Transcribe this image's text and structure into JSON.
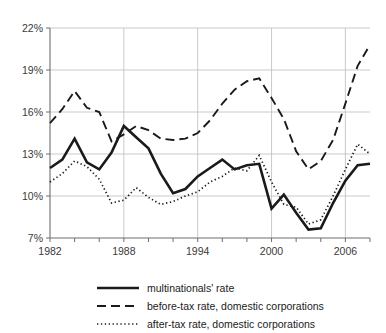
{
  "chart_data": {
    "type": "line",
    "title": "",
    "subtitle": "",
    "xlabel": "",
    "ylabel": "",
    "x": [
      1982,
      1983,
      1984,
      1985,
      1986,
      1987,
      1988,
      1989,
      1990,
      1991,
      1992,
      1993,
      1994,
      1995,
      1996,
      1997,
      1998,
      1999,
      2000,
      2001,
      2002,
      2003,
      2004,
      2005,
      2006,
      2007,
      2008
    ],
    "xlim": [
      1982,
      2008
    ],
    "ylim": [
      7,
      22
    ],
    "xticks": [
      1982,
      1988,
      1994,
      2000,
      2006
    ],
    "xticklabels": [
      "1982",
      "1988",
      "1994",
      "2000",
      "2006"
    ],
    "yticks": [
      7,
      10,
      13,
      16,
      19,
      22
    ],
    "yticklabels": [
      "7%",
      "10%",
      "13%",
      "16%",
      "19%",
      "22%"
    ],
    "grid": true,
    "legend_position": "bottom",
    "series": [
      {
        "name": "multinationals' rate",
        "style": "solid",
        "values": [
          12.0,
          12.6,
          14.1,
          12.4,
          11.9,
          13.1,
          15.0,
          14.2,
          13.4,
          11.6,
          10.2,
          10.5,
          11.4,
          12.0,
          12.6,
          11.9,
          12.2,
          12.3,
          9.1,
          10.1,
          8.8,
          7.6,
          7.7,
          9.5,
          11.1,
          12.2,
          12.3
        ]
      },
      {
        "name": "before-tax rate, domestic corporations",
        "style": "dashed",
        "values": [
          15.2,
          16.2,
          17.5,
          16.3,
          16.0,
          13.9,
          14.4,
          15.0,
          14.7,
          14.1,
          14.0,
          14.1,
          14.5,
          15.4,
          16.6,
          17.6,
          18.2,
          18.4,
          17.0,
          15.5,
          13.2,
          11.9,
          12.5,
          14.0,
          16.6,
          19.3,
          20.8
        ]
      },
      {
        "name": "after-tax rate, domestic corporations",
        "style": "dotted",
        "values": [
          11.0,
          11.6,
          12.5,
          12.1,
          11.2,
          9.5,
          9.7,
          10.6,
          9.9,
          9.4,
          9.6,
          10.0,
          10.3,
          11.0,
          11.4,
          12.0,
          11.8,
          12.9,
          11.0,
          9.4,
          9.2,
          8.0,
          8.3,
          10.0,
          11.9,
          13.7,
          13.0
        ]
      }
    ],
    "series_tail": {
      "multinationals_rate_end": [
        12.2,
        11.7,
        11.8,
        9.2
      ],
      "before_tax_end": [
        17.4,
        13.0,
        12.3,
        12.2
      ],
      "after_tax_end": [
        12.4,
        10.2,
        8.6,
        9.2
      ]
    }
  },
  "legend": {
    "items": [
      {
        "label": "multinationals' rate",
        "style": "solid"
      },
      {
        "label": "before-tax rate, domestic corporations",
        "style": "dashed"
      },
      {
        "label": "after-tax rate, domestic corporations",
        "style": "dotted"
      }
    ]
  },
  "axes": {
    "y_labels": [
      "22%",
      "19%",
      "16%",
      "13%",
      "10%",
      "7%"
    ],
    "x_labels": [
      "1982",
      "1988",
      "1994",
      "2000",
      "2006"
    ]
  }
}
